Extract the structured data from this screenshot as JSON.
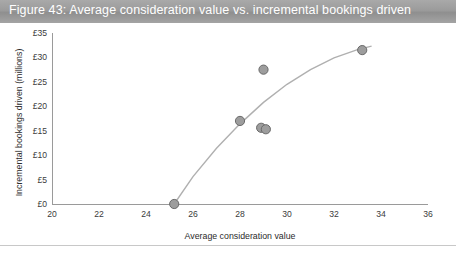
{
  "title": {
    "text": "Figure 43: Average consideration value vs. incremental bookings driven"
  },
  "colors": {
    "title_bar": "#9b9b9b",
    "title_text": "#ffffff",
    "marker_fill": "#9d9d9d",
    "marker_stroke": "#6a6a6a",
    "curve": "#b0b0b0",
    "axis": "#9a9a9a",
    "divider": "#c8c8c8"
  },
  "chart_data": {
    "type": "scatter",
    "title": "Figure 43: Average consideration value vs. incremental bookings driven",
    "xlabel": "Average consideration value",
    "ylabel": "Incremental bookings driven (millions)",
    "xlim": [
      20,
      36
    ],
    "ylim": [
      0,
      35
    ],
    "xticks": [
      20,
      22,
      24,
      26,
      28,
      30,
      32,
      34,
      36
    ],
    "yticks": [
      0,
      5,
      10,
      15,
      20,
      25,
      30,
      35
    ],
    "xtick_labels": [
      "20",
      "22",
      "24",
      "26",
      "28",
      "30",
      "32",
      "34",
      "36"
    ],
    "ytick_labels": [
      "£0",
      "£5",
      "£10",
      "£15",
      "£20",
      "£25",
      "£30",
      "£35"
    ],
    "grid": false,
    "legend": null,
    "points": [
      {
        "x": 25.2,
        "y": 0.0
      },
      {
        "x": 28.0,
        "y": 17.0
      },
      {
        "x": 28.9,
        "y": 15.6
      },
      {
        "x": 29.1,
        "y": 15.3
      },
      {
        "x": 29.0,
        "y": 27.5
      },
      {
        "x": 33.2,
        "y": 31.5
      }
    ],
    "trend_line": {
      "type": "curve",
      "description": "concave increasing trend curve from (25.2, 0) to (33.6, 32.2)",
      "x": [
        25.2,
        26.0,
        27.0,
        28.0,
        29.0,
        30.0,
        31.0,
        32.0,
        33.0,
        33.6
      ],
      "y": [
        0.0,
        5.6,
        11.4,
        16.4,
        20.8,
        24.5,
        27.5,
        29.9,
        31.6,
        32.3
      ]
    }
  }
}
